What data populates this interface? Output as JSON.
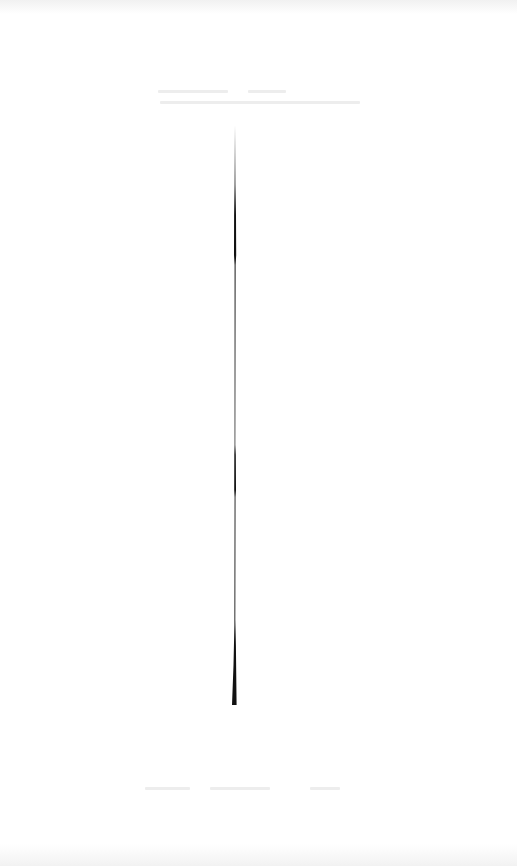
{
  "canvas": {
    "width": 517,
    "height": 866,
    "background": "#ffffff"
  },
  "stroke": {
    "color": "#111111",
    "x": 232,
    "y_start": 125,
    "y_end": 705
  },
  "faint_text_regions": [
    {
      "position": "top",
      "y": 90,
      "readable": false
    },
    {
      "position": "top",
      "y": 100,
      "readable": false
    },
    {
      "position": "bottom",
      "y": 787,
      "readable": false
    }
  ]
}
